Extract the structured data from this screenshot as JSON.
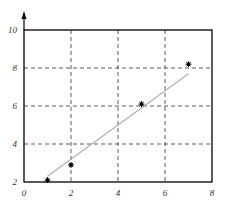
{
  "chart_data": {
    "type": "scatter",
    "title": "",
    "xlabel": "",
    "ylabel": "",
    "xlim": [
      0,
      8
    ],
    "ylim": [
      2,
      10
    ],
    "xticks": [
      0,
      2,
      4,
      6,
      8
    ],
    "yticks": [
      2,
      4,
      6,
      8,
      10
    ],
    "xtick_labels": [
      "0",
      "2",
      "4",
      "6",
      "8"
    ],
    "ytick_labels": [
      "2",
      "4",
      "6",
      "8",
      "10"
    ],
    "grid": true,
    "grid_style": "dashed",
    "legend": null,
    "series": [
      {
        "name": "data points",
        "type": "scatter",
        "marker": "asterisk",
        "color": "#000000",
        "x": [
          1,
          2,
          5,
          7
        ],
        "y": [
          2.1,
          2.9,
          6.1,
          8.2
        ]
      },
      {
        "name": "linear fit",
        "type": "line",
        "color": "#b0b0b0",
        "x": [
          1,
          7
        ],
        "y": [
          2.3,
          7.7
        ]
      }
    ]
  },
  "colors": {
    "axis": "#000000",
    "grid": "#333333",
    "fit_line": "#b0b0b0",
    "marker": "#000000",
    "label": "#333333"
  }
}
